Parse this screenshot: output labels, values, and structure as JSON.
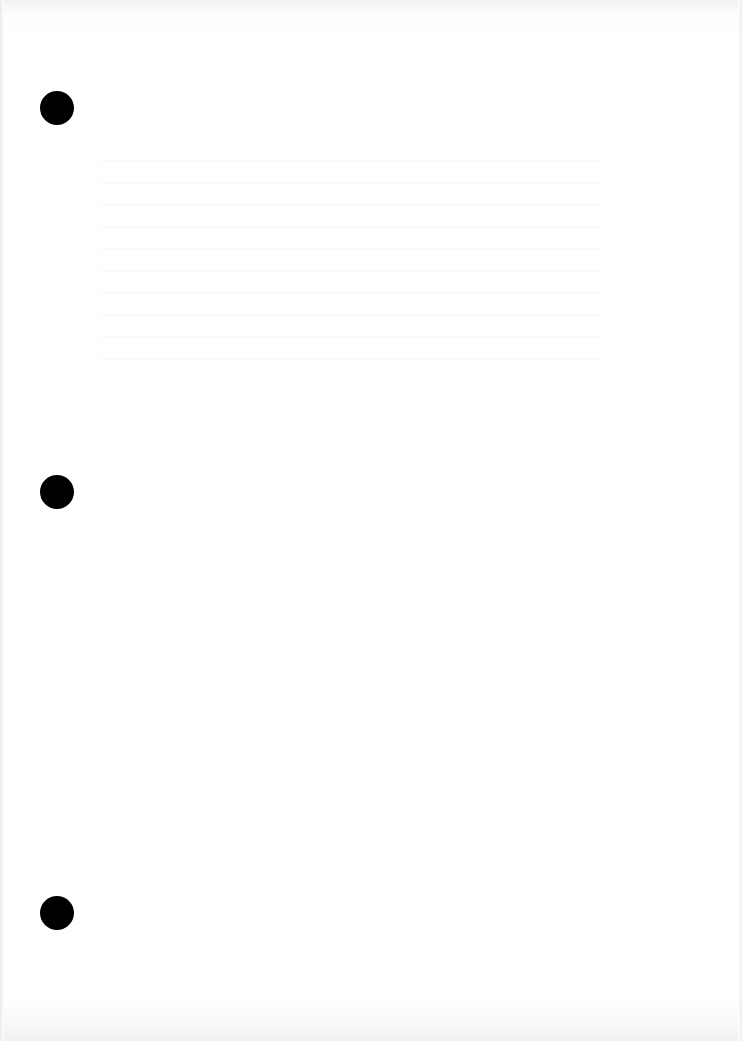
{
  "document": {
    "type": "blank scanned page",
    "punch_holes": 3,
    "background_color": "#ffffff",
    "hole_color": "#000000"
  }
}
